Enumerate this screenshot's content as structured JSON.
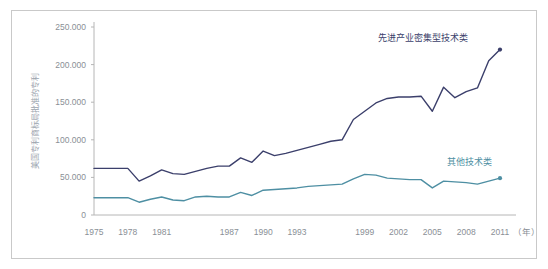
{
  "figure": {
    "background_color": "#ffffff",
    "frame_color": "#c9c9c9",
    "axis_color": "#b6b6b6",
    "tick_text_color": "#8a8f96"
  },
  "chart_data": {
    "type": "line",
    "title": "",
    "xlabel": "年",
    "ylabel": "美国专利商标局批准的专利",
    "xlim": [
      1975,
      2011
    ],
    "ylim": [
      0,
      250000
    ],
    "grid": false,
    "legend_position": "inline-annotation",
    "y_ticks": [
      0,
      50000,
      100000,
      150000,
      200000,
      250000
    ],
    "y_tick_labels": [
      "0",
      "50.000",
      "100.000",
      "150.000",
      "200.000",
      "250.000"
    ],
    "x_ticks": [
      1975,
      1978,
      1981,
      1987,
      1990,
      1993,
      1999,
      2002,
      2005,
      2008,
      2011
    ],
    "x_tick_labels": [
      "1975",
      "1978",
      "1981",
      "1987",
      "1990",
      "1993",
      "1999",
      "2002",
      "2005",
      "2008",
      "2011"
    ],
    "x_unit_label": "（年）",
    "x": [
      1975,
      1976,
      1977,
      1978,
      1979,
      1980,
      1981,
      1982,
      1983,
      1984,
      1985,
      1986,
      1987,
      1988,
      1989,
      1990,
      1991,
      1992,
      1993,
      1994,
      1995,
      1996,
      1997,
      1998,
      1999,
      2000,
      2001,
      2002,
      2003,
      2004,
      2005,
      2006,
      2007,
      2008,
      2009,
      2010,
      2011
    ],
    "series": [
      {
        "name": "先进产业密集型技术类",
        "color": "#3b3f6b",
        "marker_end": true,
        "values": [
          62000,
          62000,
          62000,
          62000,
          45000,
          52000,
          60000,
          55000,
          54000,
          58000,
          62000,
          65000,
          65000,
          76000,
          70000,
          85000,
          79000,
          82000,
          86000,
          90000,
          94000,
          98000,
          100000,
          127000,
          138000,
          149000,
          155000,
          157000,
          157000,
          158000,
          138000,
          170000,
          156000,
          164000,
          169000,
          205000,
          220000
        ]
      },
      {
        "name": "其他技术类",
        "color": "#4e8fa3",
        "marker_end": true,
        "values": [
          23000,
          23000,
          23000,
          23000,
          17000,
          21000,
          24000,
          20000,
          19000,
          24000,
          25000,
          24000,
          24000,
          30000,
          26000,
          33000,
          34000,
          35000,
          36000,
          38000,
          39000,
          40000,
          41000,
          48000,
          54000,
          53000,
          49000,
          48000,
          47000,
          47000,
          36000,
          45000,
          44000,
          43000,
          41000,
          45000,
          49000
        ]
      }
    ],
    "annotations": [
      {
        "text": "先进产业密集型技术类",
        "color": "#3b3f6b",
        "x": 2004.2,
        "y": 232000
      },
      {
        "text": "其他技术类",
        "color": "#4e8fa3",
        "x": 2008.3,
        "y": 66000
      }
    ]
  }
}
